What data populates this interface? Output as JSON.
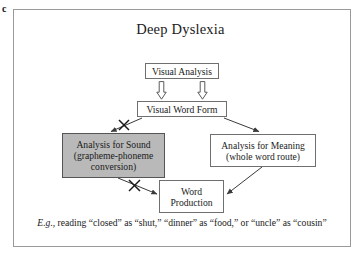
{
  "panel": {
    "letter": "c"
  },
  "diagram": {
    "title": "Deep Dyslexia",
    "type": "flowchart",
    "colors": {
      "frame_border": "#9a9a9a",
      "box_border": "#6f6f6f",
      "box_fill": "#ffffff",
      "shaded_box_fill": "#b9b9b9",
      "text": "#1a1a1a",
      "connector": "#3a3a3a"
    },
    "nodes": [
      {
        "id": "visual-analysis",
        "label": "Visual Analysis",
        "shaded": false
      },
      {
        "id": "visual-word-form",
        "label": "Visual Word Form",
        "shaded": false
      },
      {
        "id": "analysis-for-sound",
        "label": "Analysis for Sound\n(grapheme-phoneme\nconversion)",
        "shaded": true
      },
      {
        "id": "analysis-for-meaning",
        "label": "Analysis for Meaning\n(whole word route)",
        "shaded": false
      },
      {
        "id": "word-production",
        "label": "Word\nProduction",
        "shaded": false
      }
    ],
    "connectors": [
      {
        "id": "visual-analysis-to-visual-word-form-left",
        "from": "visual-analysis",
        "to": "visual-word-form",
        "style": "hollow-block-arrow",
        "blocked": false
      },
      {
        "id": "visual-analysis-to-visual-word-form-right",
        "from": "visual-analysis",
        "to": "visual-word-form",
        "style": "hollow-block-arrow",
        "blocked": false
      },
      {
        "id": "visual-word-form-to-analysis-for-sound",
        "from": "visual-word-form",
        "to": "analysis-for-sound",
        "style": "line-arrow",
        "blocked": true
      },
      {
        "id": "visual-word-form-to-analysis-for-meaning",
        "from": "visual-word-form",
        "to": "analysis-for-meaning",
        "style": "line-arrow",
        "blocked": false
      },
      {
        "id": "analysis-for-sound-to-word-production",
        "from": "analysis-for-sound",
        "to": "word-production",
        "style": "line-arrow",
        "blocked": true
      },
      {
        "id": "analysis-for-meaning-to-word-production",
        "from": "analysis-for-meaning",
        "to": "word-production",
        "style": "line-arrow",
        "blocked": false
      }
    ]
  },
  "caption": {
    "lead": "E.g.,",
    "rest": " reading “closed” as “shut,” “dinner” as “food,” or “uncle” as “cousin”"
  }
}
